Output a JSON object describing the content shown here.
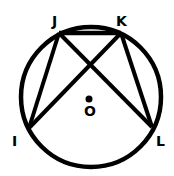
{
  "diagram": {
    "circle": {
      "center_label": "O"
    },
    "points": [
      {
        "label": "J"
      },
      {
        "label": "K"
      },
      {
        "label": "I"
      },
      {
        "label": "L"
      }
    ],
    "segments": [
      "JK",
      "JI",
      "KL",
      "JL",
      "KI"
    ]
  }
}
